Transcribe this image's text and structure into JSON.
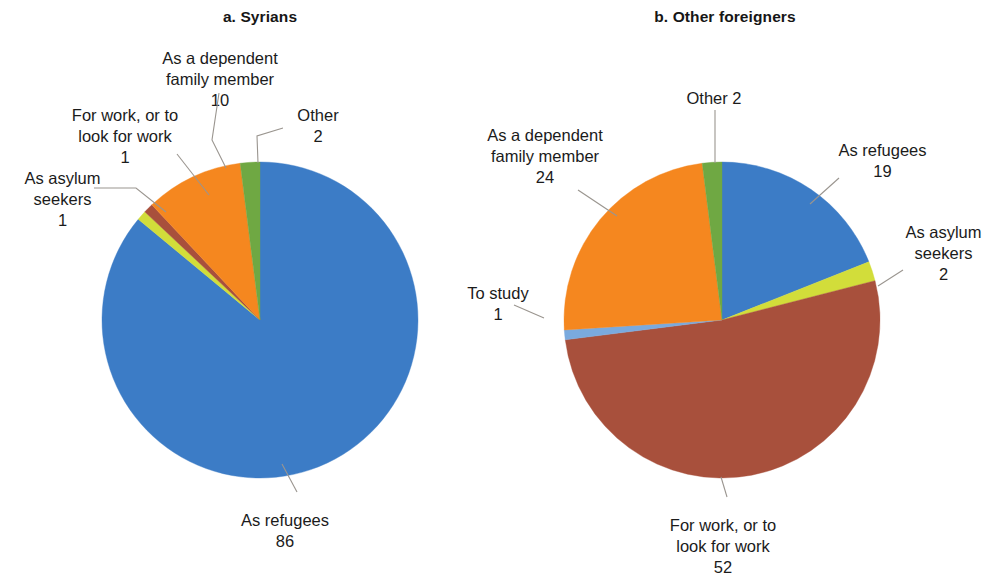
{
  "figure": {
    "background": "#ffffff",
    "palette": {
      "refugees": "#3c7cc6",
      "asylum": "#d2dd3a",
      "work": "#a8503c",
      "study": "#7aaade",
      "family": "#f5871f",
      "other": "#6fa843",
      "leader_line": "#9a958f",
      "text": "#1b1b1b"
    }
  },
  "charts": [
    {
      "id": "syrians",
      "title": "a. Syrians",
      "labels": {
        "refugees": {
          "name": "As refugees",
          "value": "86"
        },
        "asylum": {
          "name_line1": "As asylum",
          "name_line2": "seekers",
          "value": "1"
        },
        "work": {
          "name_line1": "For work, or to",
          "name_line2": "look for work",
          "value": "1"
        },
        "family": {
          "name_line1": "As a dependent",
          "name_line2": "family member",
          "value": "10"
        },
        "other": {
          "name": "Other",
          "value": "2"
        }
      }
    },
    {
      "id": "other-foreigners",
      "title": "b. Other foreigners",
      "labels": {
        "refugees": {
          "name": "As refugees",
          "value": "19"
        },
        "asylum": {
          "name_line1": "As asylum",
          "name_line2": "seekers",
          "value": "2"
        },
        "work": {
          "name_line1": "For work, or to",
          "name_line2": "look for work",
          "value": "52"
        },
        "study": {
          "name": "To study",
          "value": "1"
        },
        "family": {
          "name_line1": "As a dependent",
          "name_line2": "family member",
          "value": "24"
        },
        "other": {
          "name_and_value": "Other 2"
        }
      }
    }
  ],
  "chart_data": [
    {
      "type": "pie",
      "title": "a. Syrians",
      "total": 100,
      "units": "per cent",
      "start_angle_deg": 0,
      "direction": "clockwise",
      "categories": [
        "As refugees",
        "As asylum seekers",
        "For work, or to look for work",
        "As a dependent family member",
        "Other"
      ],
      "values": [
        86,
        1,
        1,
        10,
        2
      ],
      "colors": [
        "#3c7cc6",
        "#d2dd3a",
        "#a8503c",
        "#f5871f",
        "#6fa843"
      ],
      "legend": "none (direct labels with leader lines)",
      "grid": false
    },
    {
      "type": "pie",
      "title": "b. Other foreigners",
      "total": 100,
      "units": "per cent",
      "start_angle_deg": 0,
      "direction": "clockwise",
      "categories": [
        "As refugees",
        "As asylum seekers",
        "For work, or to look for work",
        "To study",
        "As a dependent family member",
        "Other"
      ],
      "values": [
        19,
        2,
        52,
        1,
        24,
        2
      ],
      "colors": [
        "#3c7cc6",
        "#d2dd3a",
        "#a8503c",
        "#7aaade",
        "#f5871f",
        "#6fa843"
      ],
      "legend": "none (direct labels with leader lines)",
      "grid": false
    }
  ]
}
